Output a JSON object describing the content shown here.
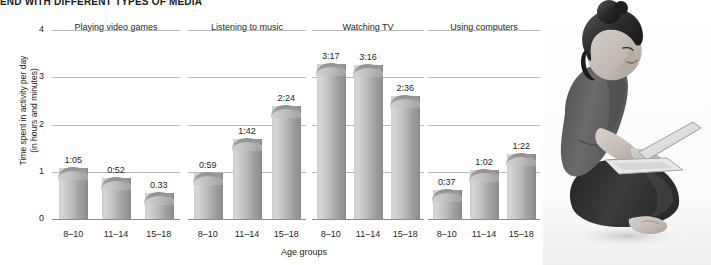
{
  "headline": "END WITH DIFFERENT TYPES OF MEDIA",
  "axes": {
    "y_title": "Time spent in activity per day\n(in hours and minutes)",
    "y_ticks": [
      "4",
      "3",
      "2",
      "1",
      "0"
    ],
    "x_title": "Age groups",
    "x_categories": [
      "8–10",
      "11–14",
      "15–18"
    ]
  },
  "photo": {
    "alt": "Young woman sitting cross-legged using a laptop"
  },
  "chart_data": {
    "type": "bar",
    "title": "END WITH DIFFERENT TYPES OF MEDIA",
    "xlabel": "Age groups",
    "ylabel": "Time spent in activity per day (in hours and minutes)",
    "ylim": [
      0,
      4
    ],
    "yticks": [
      0,
      1,
      2,
      3,
      4
    ],
    "grid": true,
    "legend": "none",
    "categories": [
      "8–10",
      "11–14",
      "15–18"
    ],
    "panels": [
      {
        "title": "Playing video games",
        "labels": [
          "1:05",
          "0:52",
          "0.33"
        ],
        "values": [
          1.083,
          0.867,
          0.55
        ]
      },
      {
        "title": "Listening to music",
        "labels": [
          "0:59",
          "1:42",
          "2:24"
        ],
        "values": [
          0.983,
          1.7,
          2.4
        ]
      },
      {
        "title": "Watching TV",
        "labels": [
          "3:17",
          "3:16",
          "2:36"
        ],
        "values": [
          3.283,
          3.267,
          2.6
        ]
      },
      {
        "title": "Using computers",
        "labels": [
          "0:37",
          "1:02",
          "1:22"
        ],
        "values": [
          0.617,
          1.033,
          1.367
        ]
      }
    ]
  }
}
